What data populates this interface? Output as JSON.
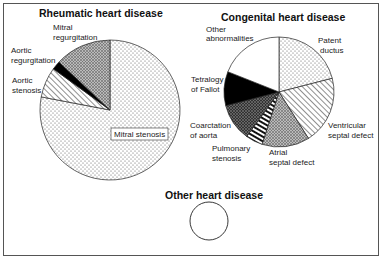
{
  "chart_data": [
    {
      "type": "pie",
      "title": "Rheumatic heart disease",
      "start_angle": "top, clockwise",
      "slices": [
        {
          "label": "Mitral stenosis",
          "value": 78,
          "pattern": "dots"
        },
        {
          "label": "Aortic stenosis",
          "value": 7,
          "pattern": "diagonal-hatch"
        },
        {
          "label": "Aortic regurgitation",
          "value": 2,
          "pattern": "solid-black"
        },
        {
          "label": "Mitral regurgitation",
          "value": 13,
          "pattern": "crosshatch-grey"
        }
      ]
    },
    {
      "type": "pie",
      "title": "Congenital heart disease",
      "start_angle": "top, clockwise",
      "slices": [
        {
          "label": "Patent ductus",
          "value": 21,
          "pattern": "dots"
        },
        {
          "label": "Ventricular septal defect",
          "value": 20,
          "pattern": "diagonal-hatch"
        },
        {
          "label": "Atrial septal defect",
          "value": 14,
          "pattern": "crosshatch-grey"
        },
        {
          "label": "Pulmonary stenosis",
          "value": 5,
          "pattern": "thick-stripes"
        },
        {
          "label": "Coarctation of aorta",
          "value": 11,
          "pattern": "dark-crosshatch"
        },
        {
          "label": "Tetralogy of Fallot",
          "value": 10,
          "pattern": "solid-black"
        },
        {
          "label": "Other abnormalities",
          "value": 19,
          "pattern": "white"
        }
      ]
    },
    {
      "type": "pie",
      "title": "Other heart disease",
      "slices": [
        {
          "label": "",
          "value": 100,
          "pattern": "white"
        }
      ]
    }
  ],
  "labels": {
    "rheum_title": "Rheumatic heart disease",
    "rheum_mr_1": "Mitral",
    "rheum_mr_2": "regurgitation",
    "rheum_ar_1": "Aortic",
    "rheum_ar_2": "regurgitation",
    "rheum_as_1": "Aortic",
    "rheum_as_2": "stenosis",
    "rheum_ms": "Mitral stenosis",
    "cong_title": "Congenital heart disease",
    "cong_other_1": "Other",
    "cong_other_2": "abnormalities",
    "cong_pd_1": "Patent",
    "cong_pd_2": "ductus",
    "cong_tof_1": "Tetralogy",
    "cong_tof_2": "of Fallot",
    "cong_coa_1": "Coarctation",
    "cong_coa_2": "of aorta",
    "cong_ps_1": "Pulmonary",
    "cong_ps_2": "stenosis",
    "cong_asd_1": "Atrial",
    "cong_asd_2": "septal defect",
    "cong_vsd_1": "Ventricular",
    "cong_vsd_2": "septal defect",
    "other_title": "Other heart disease"
  }
}
